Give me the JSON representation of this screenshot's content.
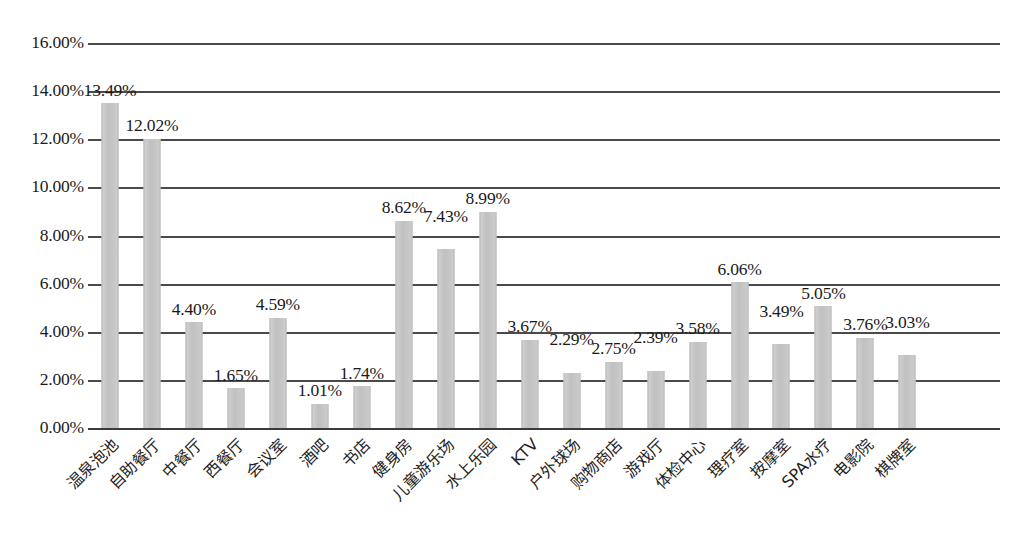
{
  "chart_data": {
    "type": "bar",
    "title": "",
    "xlabel": "",
    "ylabel": "",
    "ylim": [
      0,
      16
    ],
    "ytick_labels": [
      "16.00%",
      "14.00%",
      "12.00%",
      "10.00%",
      "8.00%",
      "6.00%",
      "4.00%",
      "2.00%",
      "0.00%"
    ],
    "ytick_values": [
      16,
      14,
      12,
      10,
      8,
      6,
      4,
      2,
      0
    ],
    "grid": true,
    "legend": false,
    "categories": [
      "温泉泡池",
      "自助餐厅",
      "中餐厅",
      "西餐厅",
      "会议室",
      "酒吧",
      "书店",
      "健身房",
      "儿童游乐场",
      "水上乐园",
      "KTV",
      "户外球场",
      "购物商店",
      "游戏厅",
      "体检中心",
      "理疗室",
      "按摩室",
      "SPA水疗",
      "电影院",
      "棋牌室"
    ],
    "values": [
      13.49,
      12.02,
      4.4,
      1.65,
      4.59,
      1.01,
      1.74,
      8.62,
      7.43,
      8.99,
      3.67,
      2.29,
      2.75,
      2.39,
      3.58,
      6.06,
      3.49,
      5.05,
      3.76,
      3.03
    ],
    "value_labels": [
      "13.49%",
      "12.02%",
      "4.40%",
      "1.65%",
      "4.59%",
      "1.01%",
      "1.74%",
      "8.62%",
      "7.43%",
      "8.99%",
      "3.67%",
      "2.29%",
      "2.75%",
      "2.39%",
      "3.58%",
      "6.06%",
      "3.49%",
      "5.05%",
      "3.76%",
      "3.03%"
    ],
    "bar_color": "#c6c6c6",
    "gridline_color": "#4a4a4a",
    "label_offsets_px": [
      0,
      0,
      0,
      0,
      0,
      0,
      0,
      0,
      20,
      0,
      0,
      20,
      0,
      20,
      0,
      0,
      20,
      0,
      0,
      20
    ]
  }
}
